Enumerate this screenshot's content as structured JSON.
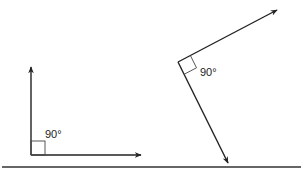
{
  "figure": {
    "left_angle": {
      "label": "90°"
    },
    "right_angle": {
      "label": "90°"
    }
  },
  "colors": {
    "stroke": "#222222",
    "background": "#ffffff"
  }
}
